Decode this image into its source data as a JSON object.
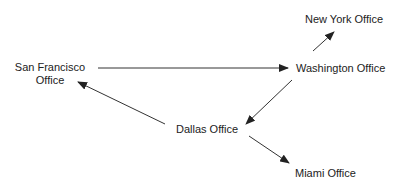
{
  "diagram": {
    "type": "directed-graph",
    "nodes": [
      {
        "id": "sf",
        "label_line1": "San Francisco",
        "label_line2": "Office"
      },
      {
        "id": "washington",
        "label": "Washington Office"
      },
      {
        "id": "newyork",
        "label": "New York Office"
      },
      {
        "id": "dallas",
        "label": "Dallas Office"
      },
      {
        "id": "miami",
        "label": "Miami Office"
      }
    ],
    "edges": [
      {
        "from": "San Francisco Office",
        "to": "Washington Office"
      },
      {
        "from": "Washington Office",
        "to": "New York Office"
      },
      {
        "from": "Washington Office",
        "to": "Dallas Office"
      },
      {
        "from": "Dallas Office",
        "to": "San Francisco Office"
      },
      {
        "from": "Dallas Office",
        "to": "Miami Office"
      }
    ],
    "colors": {
      "line": "#333333",
      "text": "#222222",
      "background": "#ffffff"
    }
  }
}
